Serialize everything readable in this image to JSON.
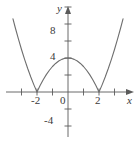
{
  "figure": {
    "name": "coordinate-graph",
    "width": 139,
    "height": 143,
    "background_color": "#ffffff",
    "curve_color": "#6e6e6e",
    "axis_color": "#5a5a5a",
    "text_color": "#3a3a3a"
  },
  "axes": {
    "x_axis_label": "x",
    "y_axis_label": "y",
    "x_tick_labels": [
      "-2",
      "0",
      "2"
    ],
    "y_tick_labels": [
      "8",
      "4",
      "-4"
    ],
    "x_label_minus2": "-2",
    "x_label_zero": "0",
    "x_label_two": "2",
    "y_label_eight": "8",
    "y_label_four": "4",
    "y_label_minus_four": "-4"
  },
  "chart_data": {
    "type": "line",
    "title": "",
    "xlabel": "x",
    "ylabel": "y",
    "xlim": [
      -4.4,
      4.6
    ],
    "ylim": [
      -6.4,
      11.6
    ],
    "xticks": [
      -3,
      -2,
      -1,
      0,
      1,
      2,
      3
    ],
    "yticks": [
      -4,
      -2,
      2,
      4,
      6,
      8,
      10
    ],
    "xtick_labels": [
      "",
      "-2",
      "",
      "0",
      "",
      "2",
      ""
    ],
    "ytick_labels": [
      "-4",
      "",
      "",
      "4",
      "",
      "8",
      ""
    ],
    "grid": false,
    "legend": null,
    "series": [
      {
        "name": "y = |4 - x^2|",
        "equation": "y = |4 - x^2|",
        "x": [
          -3.55,
          -3.4,
          -3.2,
          -3.0,
          -2.8,
          -2.6,
          -2.4,
          -2.2,
          -2.0,
          -1.8,
          -1.6,
          -1.4,
          -1.2,
          -1.0,
          -0.8,
          -0.6,
          -0.4,
          -0.2,
          0.0,
          0.2,
          0.4,
          0.6,
          0.8,
          1.0,
          1.2,
          1.4,
          1.6,
          1.8,
          2.0,
          2.2,
          2.4,
          2.6,
          2.8,
          3.0,
          3.2,
          3.4,
          3.55
        ],
        "y": [
          8.6,
          7.56,
          6.24,
          5.0,
          3.84,
          2.76,
          1.76,
          0.84,
          0.0,
          0.76,
          1.44,
          2.04,
          2.56,
          3.0,
          3.36,
          3.64,
          3.84,
          3.96,
          4.0,
          3.96,
          3.84,
          3.64,
          3.36,
          3.0,
          2.56,
          2.04,
          1.44,
          0.76,
          0.0,
          0.84,
          1.76,
          2.76,
          3.84,
          5.0,
          6.24,
          7.56,
          8.6
        ]
      }
    ],
    "annotations": [
      {
        "label": "vertex",
        "x": 0,
        "y": 4
      },
      {
        "label": "x-intercept",
        "x": -2,
        "y": 0
      },
      {
        "label": "x-intercept",
        "x": 2,
        "y": 0
      }
    ]
  }
}
